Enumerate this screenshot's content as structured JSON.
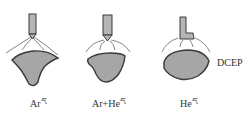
{
  "figure": {
    "panels": [
      {
        "gas": "Ar",
        "sup": "气",
        "suffix": "",
        "label_text": "Ar气",
        "bead_shape": "finger penetration (wide top, narrow deep tongue)"
      },
      {
        "gas": "Ar+He",
        "sup": "气",
        "suffix": "",
        "label_text": "Ar+He气",
        "bead_shape": "rounded triangular"
      },
      {
        "gas": "He",
        "sup": "气",
        "suffix": "",
        "label_text": "He气",
        "bead_shape": "wide shallow oval"
      }
    ],
    "polarity_label": "DCEP",
    "colors": {
      "bead_fill": "#a6a6a6",
      "outline": "#3a3a3a",
      "electrode_fill": "#b5b5b5",
      "arc_lines": "#666666"
    }
  }
}
